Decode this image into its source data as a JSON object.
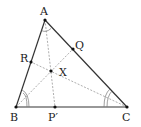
{
  "diagram": {
    "type": "triangle-geometry",
    "points": {
      "A": {
        "label": "A",
        "x": 45,
        "y": 20
      },
      "B": {
        "label": "B",
        "x": 16,
        "y": 107
      },
      "C": {
        "label": "C",
        "x": 127,
        "y": 107
      },
      "Q": {
        "label": "Q",
        "x": 73,
        "y": 49
      },
      "R": {
        "label": "R",
        "x": 31,
        "y": 62
      },
      "X": {
        "label": "X",
        "x": 51,
        "y": 71
      },
      "P": {
        "label": "P′",
        "x": 55,
        "y": 107
      }
    },
    "solid_segments": [
      "AB",
      "BC",
      "CA"
    ],
    "dashed_segments": [
      "AP′",
      "BQ",
      "CR"
    ],
    "angle_marks": [
      {
        "vertex": "A",
        "style": "single-arc",
        "note": "angle bisected"
      },
      {
        "vertex": "B",
        "style": "double-arc",
        "note": "angle bisected"
      },
      {
        "vertex": "C",
        "style": "double-arc",
        "note": "angle bisected"
      }
    ],
    "colors": {
      "stroke": "#333333",
      "dashed": "#888888",
      "point": "#111111"
    }
  }
}
